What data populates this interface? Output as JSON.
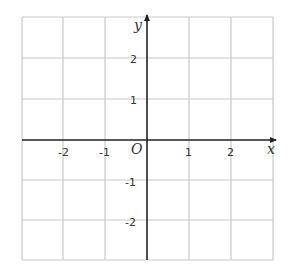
{
  "diagram": {
    "type": "coordinate-plane",
    "x_axis_label": "x",
    "y_axis_label": "y",
    "origin_label": "O",
    "x_range": [
      -3,
      3
    ],
    "y_range": [
      -3,
      3
    ],
    "grid_step": 1,
    "x_ticks": [
      {
        "value": -2,
        "label": "-2"
      },
      {
        "value": -1,
        "label": "-1"
      },
      {
        "value": 1,
        "label": "1"
      },
      {
        "value": 2,
        "label": "2"
      }
    ],
    "y_ticks": [
      {
        "value": 2,
        "label": "2"
      },
      {
        "value": 1,
        "label": "1"
      },
      {
        "value": -1,
        "label": "-1"
      },
      {
        "value": -2,
        "label": "-2"
      }
    ],
    "colors": {
      "grid": "#c8c8c8",
      "axis": "#222222",
      "text": "#333333"
    }
  }
}
